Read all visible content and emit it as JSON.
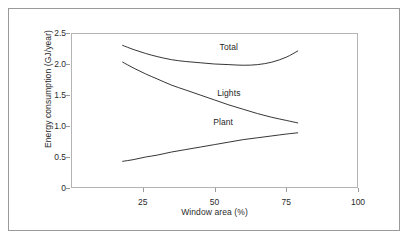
{
  "chart_data": {
    "type": "line",
    "title": "",
    "xlabel": "Window area (%)",
    "ylabel": "Energy consumption (GJ/year)",
    "xlim": [
      0,
      100
    ],
    "ylim": [
      0,
      2.5
    ],
    "xticks": [
      25,
      50,
      75,
      100
    ],
    "xtick_labels": [
      "25",
      "50",
      "75",
      "100"
    ],
    "yticks": [
      0,
      0.5,
      1.0,
      1.5,
      2.0,
      2.5
    ],
    "ytick_labels": [
      "0",
      "0.5",
      "1.0",
      "1.5",
      "2.0",
      "2.5"
    ],
    "grid": false,
    "legend": "inline-curve-labels",
    "series": [
      {
        "name": "Total",
        "label": "Total",
        "label_x": 55,
        "label_y": 2.28,
        "x": [
          18,
          22,
          26,
          30,
          35,
          40,
          45,
          50,
          55,
          60,
          65,
          70,
          75,
          79
        ],
        "y": [
          2.3,
          2.23,
          2.17,
          2.12,
          2.07,
          2.04,
          2.02,
          2.0,
          1.99,
          1.98,
          1.99,
          2.03,
          2.11,
          2.21
        ]
      },
      {
        "name": "Lights",
        "label": "Lights",
        "label_x": 55,
        "label_y": 1.54,
        "x": [
          18,
          22,
          26,
          30,
          35,
          40,
          45,
          50,
          55,
          60,
          65,
          70,
          75,
          79
        ],
        "y": [
          2.03,
          1.93,
          1.84,
          1.76,
          1.66,
          1.58,
          1.5,
          1.42,
          1.34,
          1.27,
          1.2,
          1.14,
          1.09,
          1.05
        ]
      },
      {
        "name": "Plant",
        "label": "Plant",
        "label_x": 53,
        "label_y": 1.07,
        "x": [
          18,
          22,
          26,
          30,
          35,
          40,
          45,
          50,
          55,
          60,
          65,
          70,
          75,
          79
        ],
        "y": [
          0.43,
          0.46,
          0.5,
          0.53,
          0.58,
          0.62,
          0.66,
          0.7,
          0.74,
          0.78,
          0.81,
          0.84,
          0.87,
          0.89
        ]
      }
    ],
    "colors": {
      "curve": "#1f1f1f",
      "axis": "#b4b4b4",
      "outer_frame": "#9a9a9a",
      "text": "#2b2b2b",
      "background": "#ffffff"
    }
  }
}
